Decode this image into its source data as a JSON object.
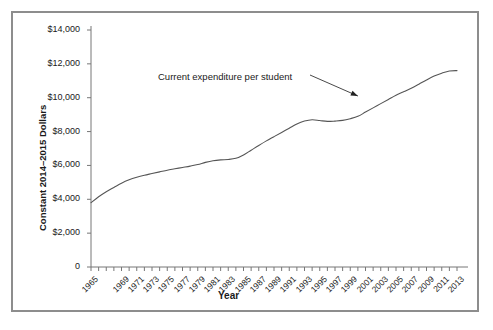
{
  "figure": {
    "border_color": "#8d8d8d",
    "background": "#ffffff"
  },
  "chart_data": {
    "type": "line",
    "title": "",
    "xlabel": "Year",
    "ylabel": "Constant 2014–2015 Dollars",
    "ylim": [
      0,
      14000
    ],
    "xlim": [
      1965,
      2013
    ],
    "grid": false,
    "legend": null,
    "line_color": "#555555",
    "ytick_labels": [
      "$14,000",
      "$12,000",
      "$10,000",
      "$8,000",
      "$6,000",
      "$4,000",
      "$2,000",
      "0"
    ],
    "ytick_values": [
      14000,
      12000,
      10000,
      8000,
      6000,
      4000,
      2000,
      0
    ],
    "xtick_labels": [
      "1965",
      "1969",
      "1971",
      "1973",
      "1975",
      "1977",
      "1979",
      "1981",
      "1983",
      "1985",
      "1987",
      "1989",
      "1991",
      "1993",
      "1995",
      "1997",
      "1999",
      "2001",
      "2003",
      "2005",
      "2007",
      "2009",
      "2011",
      "2013"
    ],
    "annotations": [
      {
        "text": "Current expenditure per student",
        "points_to_year": 2000,
        "points_to_value": 10100
      }
    ],
    "series": [
      {
        "name": "Current expenditure per student",
        "x": [
          1965,
          1966,
          1967,
          1968,
          1969,
          1970,
          1971,
          1972,
          1973,
          1974,
          1975,
          1976,
          1977,
          1978,
          1979,
          1980,
          1981,
          1982,
          1983,
          1984,
          1985,
          1986,
          1987,
          1988,
          1989,
          1990,
          1991,
          1992,
          1993,
          1994,
          1995,
          1996,
          1997,
          1998,
          1999,
          2000,
          2001,
          2002,
          2003,
          2004,
          2005,
          2006,
          2007,
          2008,
          2009,
          2010,
          2011,
          2012,
          2013
        ],
        "values": [
          3800,
          4150,
          4450,
          4700,
          4950,
          5150,
          5300,
          5420,
          5520,
          5620,
          5720,
          5800,
          5880,
          5960,
          6050,
          6180,
          6280,
          6330,
          6350,
          6420,
          6620,
          6900,
          7180,
          7450,
          7700,
          7950,
          8200,
          8450,
          8620,
          8700,
          8650,
          8600,
          8620,
          8660,
          8760,
          8900,
          9150,
          9400,
          9650,
          9900,
          10150,
          10350,
          10560,
          10800,
          11050,
          11280,
          11450,
          11580,
          11600
        ]
      }
    ]
  }
}
